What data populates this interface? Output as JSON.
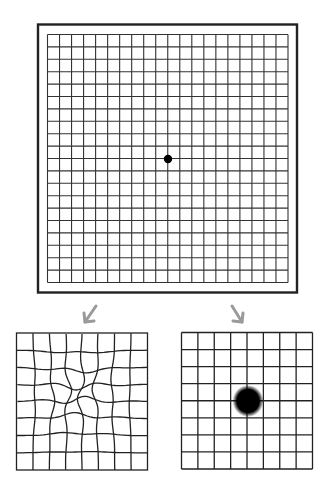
{
  "figure": {
    "main_grid": {
      "label": "amsler-grid",
      "cells": 20,
      "fixation_dot": true
    },
    "arrows": [
      {
        "label": "arrow-to-distorted",
        "color": "#9a9a9a"
      },
      {
        "label": "arrow-to-scotoma",
        "color": "#9a9a9a"
      }
    ],
    "examples": [
      {
        "label": "metamorphopsia-grid",
        "cells": 8,
        "effect": "wavy distorted lines"
      },
      {
        "label": "scotoma-grid",
        "cells": 8,
        "effect": "central dark spot"
      }
    ],
    "colors": {
      "line": "#2a2a2a",
      "frame": "#222222",
      "arrow": "#9a9a9a",
      "background": "#ffffff"
    }
  }
}
